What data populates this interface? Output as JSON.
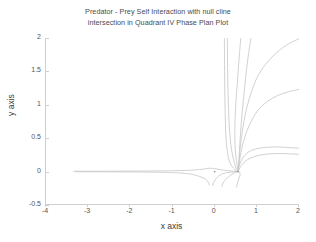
{
  "chart_data": {
    "type": "line",
    "title": "Predator - Prey Self Interaction with null cline intersection in Quadrant IV Phase Plan Plot",
    "title_lines": [
      "Predator - Prey Self Interaction with null cline",
      "intersection in Quadrant IV Phase Plan Plot"
    ],
    "xlabel": "x axis",
    "ylabel": "y axis",
    "xlim": [
      -4,
      2
    ],
    "ylim": [
      -0.5,
      2
    ],
    "xticks": [
      "-4",
      "-3",
      "-2",
      "-1",
      "0",
      "1",
      "2"
    ],
    "xtick_values": [
      -4,
      -3,
      -2,
      -1,
      0,
      1,
      2
    ],
    "yticks": [
      "-0.5",
      "0",
      "0.5",
      "1",
      "1.5",
      "2"
    ],
    "ytick_values": [
      -0.5,
      0,
      0.5,
      1,
      1.5,
      2
    ],
    "grid": false,
    "legend": "none",
    "line_color": "#c9c9c9",
    "axis_color": "#cfcfcf",
    "background": "#ffffff",
    "equilibrium_points": [
      {
        "x": 0.55,
        "y": 0.0,
        "type": "stable-node"
      },
      {
        "x": 0.0,
        "y": 0.0,
        "type": "saddle"
      }
    ],
    "series": [
      {
        "name": "trajectory-left-incoming",
        "points": [
          [
            -3.35,
            0.005
          ],
          [
            -2.6,
            0.006
          ],
          [
            -1.8,
            0.008
          ],
          [
            -1.1,
            0.012
          ],
          [
            -0.6,
            0.02
          ],
          [
            -0.3,
            0.035
          ],
          [
            -0.12,
            0.05
          ],
          [
            0.0,
            0.045
          ],
          [
            0.12,
            0.03
          ],
          [
            0.3,
            0.015
          ],
          [
            0.45,
            0.006
          ],
          [
            0.55,
            0.0
          ]
        ]
      },
      {
        "name": "trajectory-left-lower",
        "points": [
          [
            -3.3,
            -0.002
          ],
          [
            -2.4,
            -0.004
          ],
          [
            -1.5,
            -0.008
          ],
          [
            -0.9,
            -0.018
          ],
          [
            -0.55,
            -0.04
          ],
          [
            -0.35,
            -0.075
          ],
          [
            -0.22,
            -0.11
          ],
          [
            -0.16,
            -0.15
          ],
          [
            -0.13,
            -0.2
          ]
        ]
      },
      {
        "name": "trajectory-lower-inner-left",
        "points": [
          [
            -0.05,
            -0.21
          ],
          [
            -0.02,
            -0.16
          ],
          [
            0.03,
            -0.11
          ],
          [
            0.1,
            -0.065
          ],
          [
            0.2,
            -0.03
          ],
          [
            0.33,
            -0.012
          ],
          [
            0.45,
            -0.004
          ],
          [
            0.55,
            0.0
          ]
        ]
      },
      {
        "name": "trajectory-lower-inner-right",
        "points": [
          [
            0.17,
            -0.22
          ],
          [
            0.2,
            -0.17
          ],
          [
            0.26,
            -0.12
          ],
          [
            0.33,
            -0.075
          ],
          [
            0.41,
            -0.04
          ],
          [
            0.48,
            -0.015
          ],
          [
            0.55,
            0.0
          ]
        ]
      },
      {
        "name": "trajectory-lower-right",
        "points": [
          [
            0.52,
            -0.23
          ],
          [
            0.54,
            -0.17
          ],
          [
            0.57,
            -0.11
          ],
          [
            0.6,
            -0.06
          ],
          [
            0.6,
            -0.025
          ],
          [
            0.58,
            0.0
          ]
        ]
      },
      {
        "name": "trajectory-vertical-asymptote",
        "points": [
          [
            0.23,
            2.0
          ],
          [
            0.235,
            1.6
          ],
          [
            0.24,
            1.2
          ],
          [
            0.25,
            0.85
          ],
          [
            0.265,
            0.55
          ],
          [
            0.3,
            0.3
          ],
          [
            0.36,
            0.14
          ],
          [
            0.45,
            0.05
          ],
          [
            0.55,
            0.0
          ]
        ]
      },
      {
        "name": "trajectory-near-vertical-2",
        "points": [
          [
            0.3,
            2.0
          ],
          [
            0.305,
            1.65
          ],
          [
            0.315,
            1.25
          ],
          [
            0.33,
            0.9
          ],
          [
            0.355,
            0.6
          ],
          [
            0.4,
            0.33
          ],
          [
            0.46,
            0.15
          ],
          [
            0.51,
            0.05
          ],
          [
            0.56,
            0.0
          ]
        ]
      },
      {
        "name": "trajectory-curved-steep",
        "points": [
          [
            0.62,
            2.0
          ],
          [
            0.58,
            1.7
          ],
          [
            0.54,
            1.35
          ],
          [
            0.5,
            1.0
          ],
          [
            0.48,
            0.7
          ],
          [
            0.48,
            0.45
          ],
          [
            0.5,
            0.25
          ],
          [
            0.53,
            0.1
          ],
          [
            0.56,
            0.0
          ]
        ]
      },
      {
        "name": "trajectory-bow-right-upper",
        "points": [
          [
            2.0,
            1.99
          ],
          [
            1.72,
            1.9
          ],
          [
            1.45,
            1.77
          ],
          [
            1.2,
            1.6
          ],
          [
            1.0,
            1.4
          ],
          [
            0.85,
            1.15
          ],
          [
            0.74,
            0.9
          ],
          [
            0.66,
            0.62
          ],
          [
            0.61,
            0.38
          ],
          [
            0.58,
            0.18
          ],
          [
            0.56,
            0.02
          ]
        ]
      },
      {
        "name": "trajectory-bow-right-mid",
        "points": [
          [
            2.0,
            1.23
          ],
          [
            1.78,
            1.2
          ],
          [
            1.5,
            1.14
          ],
          [
            1.25,
            1.05
          ],
          [
            1.04,
            0.93
          ],
          [
            0.88,
            0.77
          ],
          [
            0.76,
            0.6
          ],
          [
            0.67,
            0.42
          ],
          [
            0.61,
            0.24
          ],
          [
            0.57,
            0.08
          ],
          [
            0.56,
            0.0
          ]
        ]
      },
      {
        "name": "trajectory-bow-right-low",
        "points": [
          [
            2.0,
            0.35
          ],
          [
            1.75,
            0.36
          ],
          [
            1.5,
            0.37
          ],
          [
            1.26,
            0.365
          ],
          [
            1.05,
            0.35
          ],
          [
            0.88,
            0.32
          ],
          [
            0.75,
            0.27
          ],
          [
            0.66,
            0.2
          ],
          [
            0.6,
            0.12
          ],
          [
            0.57,
            0.05
          ],
          [
            0.56,
            0.0
          ]
        ]
      },
      {
        "name": "trajectory-bow-right-lowest",
        "points": [
          [
            2.0,
            0.26
          ],
          [
            1.8,
            0.265
          ],
          [
            1.55,
            0.27
          ],
          [
            1.3,
            0.265
          ],
          [
            1.1,
            0.25
          ],
          [
            0.92,
            0.22
          ],
          [
            0.78,
            0.18
          ],
          [
            0.67,
            0.12
          ],
          [
            0.6,
            0.06
          ],
          [
            0.57,
            0.02
          ],
          [
            0.56,
            0.0
          ]
        ]
      },
      {
        "name": "trajectory-top-short",
        "points": [
          [
            0.86,
            2.0
          ],
          [
            0.8,
            1.75
          ],
          [
            0.75,
            1.5
          ],
          [
            0.71,
            1.25
          ],
          [
            0.67,
            1.0
          ],
          [
            0.63,
            0.72
          ],
          [
            0.6,
            0.45
          ],
          [
            0.58,
            0.22
          ],
          [
            0.56,
            0.0
          ]
        ]
      }
    ]
  }
}
